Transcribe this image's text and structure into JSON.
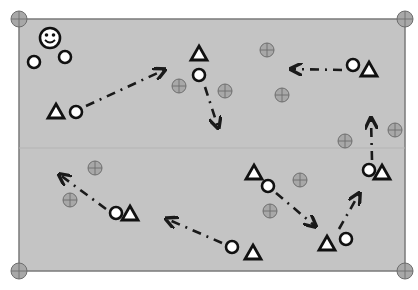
{
  "diagram": {
    "type": "sports-drill-field",
    "colors": {
      "field": "#c4c4c4",
      "field_border": "#7a7a7a",
      "midline": "#b4b4b4",
      "cone_fill": "#a8a8a8",
      "cone_stroke": "#6e6e6e",
      "player_stroke": "#111111",
      "player_fill": "#ffffff",
      "arrow": "#1a1a1a"
    },
    "field": {
      "x": 19,
      "y": 19,
      "width": 386,
      "height": 252,
      "midline_y": 148
    },
    "corner_markers": [
      {
        "x": 19,
        "y": 19
      },
      {
        "x": 405,
        "y": 19
      },
      {
        "x": 19,
        "y": 271
      },
      {
        "x": 405,
        "y": 271
      }
    ],
    "coach": {
      "icon": "smiley-face-icon",
      "x": 50,
      "y": 38
    },
    "circles": [
      {
        "x": 34,
        "y": 62
      },
      {
        "x": 65,
        "y": 57
      },
      {
        "x": 76,
        "y": 112
      },
      {
        "x": 199,
        "y": 75
      },
      {
        "x": 353,
        "y": 65
      },
      {
        "x": 369,
        "y": 170
      },
      {
        "x": 268,
        "y": 186
      },
      {
        "x": 346,
        "y": 239
      },
      {
        "x": 116,
        "y": 213
      },
      {
        "x": 232,
        "y": 247
      }
    ],
    "triangles": [
      {
        "x": 56,
        "y": 112
      },
      {
        "x": 199,
        "y": 54
      },
      {
        "x": 369,
        "y": 70
      },
      {
        "x": 382,
        "y": 173
      },
      {
        "x": 254,
        "y": 173
      },
      {
        "x": 327,
        "y": 244
      },
      {
        "x": 130,
        "y": 214
      },
      {
        "x": 253,
        "y": 253
      }
    ],
    "cones": [
      {
        "x": 267,
        "y": 50
      },
      {
        "x": 179,
        "y": 86
      },
      {
        "x": 225,
        "y": 91
      },
      {
        "x": 282,
        "y": 95
      },
      {
        "x": 345,
        "y": 141
      },
      {
        "x": 395,
        "y": 130
      },
      {
        "x": 95,
        "y": 168
      },
      {
        "x": 70,
        "y": 200
      },
      {
        "x": 300,
        "y": 180
      },
      {
        "x": 270,
        "y": 211
      }
    ],
    "arrows": [
      {
        "from": [
          86,
          106
        ],
        "to": [
          164,
          70
        ]
      },
      {
        "from": [
          205,
          87
        ],
        "to": [
          218,
          127
        ]
      },
      {
        "from": [
          342,
          70
        ],
        "to": [
          292,
          69
        ]
      },
      {
        "from": [
          372,
          160
        ],
        "to": [
          371,
          119
        ]
      },
      {
        "from": [
          276,
          193
        ],
        "to": [
          315,
          226
        ]
      },
      {
        "from": [
          339,
          229
        ],
        "to": [
          359,
          194
        ]
      },
      {
        "from": [
          106,
          209
        ],
        "to": [
          60,
          175
        ]
      },
      {
        "from": [
          222,
          243
        ],
        "to": [
          167,
          219
        ]
      }
    ]
  }
}
